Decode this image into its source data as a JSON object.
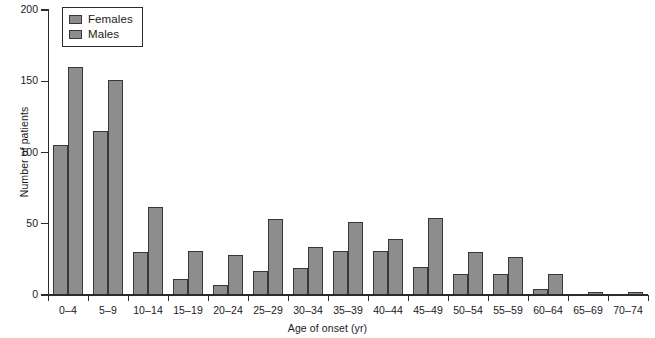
{
  "chart_data": {
    "type": "bar",
    "title": "",
    "xlabel": "Age of onset (yr)",
    "ylabel": "Number of patients",
    "ylim": [
      0,
      200
    ],
    "yticks": [
      0,
      50,
      100,
      150,
      200
    ],
    "grid": false,
    "legend_position": "top-left",
    "categories": [
      "0–4",
      "5–9",
      "10–14",
      "15–19",
      "20–24",
      "25–29",
      "30–34",
      "35–39",
      "40–44",
      "45–49",
      "50–54",
      "55–59",
      "60–64",
      "65–69",
      "70–74"
    ],
    "series": [
      {
        "name": "Females",
        "color": "#8d8d8d",
        "values": [
          105,
          115,
          30,
          11,
          7,
          17,
          19,
          31,
          31,
          20,
          15,
          15,
          4,
          0,
          0
        ]
      },
      {
        "name": "Males",
        "color": "#8d8d8d",
        "values": [
          160,
          151,
          62,
          31,
          28,
          53,
          34,
          51,
          39,
          54,
          30,
          27,
          15,
          2,
          2
        ]
      }
    ]
  },
  "axes": {
    "y_title": "Number of patients",
    "x_title": "Age of onset (yr)",
    "y_tick_labels": [
      "0",
      "50",
      "100",
      "150",
      "200"
    ]
  },
  "legend": {
    "entries": [
      {
        "label": "Females",
        "swatch": "#8d8d8d"
      },
      {
        "label": "Males",
        "swatch": "#8d8d8d"
      }
    ]
  }
}
